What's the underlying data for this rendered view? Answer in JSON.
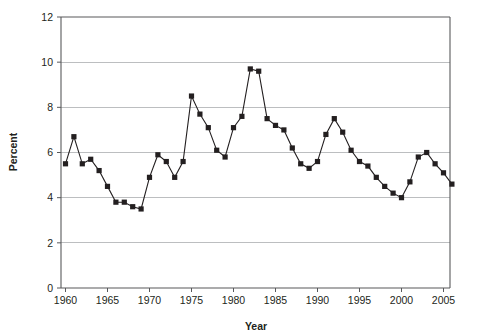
{
  "chart_data": {
    "type": "line",
    "title": "",
    "subtitle": "",
    "xlabel": "Year",
    "ylabel": "Percent",
    "xlim": [
      1959.2,
      1966.0
    ],
    "ylim": [
      0,
      12
    ],
    "xtick_labels": [
      "1960",
      "1965",
      "1970",
      "1975",
      "1980",
      "1985",
      "1990",
      "1995",
      "2000",
      "2005"
    ],
    "xticks": [
      1960,
      1965,
      1970,
      1975,
      1980,
      1985,
      1990,
      1995,
      2000,
      2005
    ],
    "ytick_labels": [
      "0",
      "2",
      "4",
      "6",
      "8",
      "10",
      "12"
    ],
    "yticks": [
      0,
      2,
      4,
      6,
      8,
      10,
      12
    ],
    "grid": "horizontal",
    "legend": "none",
    "marker": "square",
    "x": [
      1960,
      1961,
      1962,
      1963,
      1964,
      1965,
      1966,
      1967,
      1968,
      1969,
      1970,
      1971,
      1972,
      1973,
      1974,
      1975,
      1976,
      1977,
      1978,
      1979,
      1980,
      1981,
      1982,
      1983,
      1984,
      1985,
      1986,
      1987,
      1988,
      1989,
      1990,
      1991,
      1992,
      1993,
      1994,
      1995,
      1996,
      1997,
      1998,
      1999,
      2000,
      2001,
      2002,
      2003,
      2004,
      2005,
      2006
    ],
    "series": [
      {
        "name": "Percent",
        "values": [
          5.5,
          6.7,
          5.5,
          5.7,
          5.2,
          4.5,
          3.8,
          3.8,
          3.6,
          3.5,
          4.9,
          5.9,
          5.6,
          4.9,
          5.6,
          8.5,
          7.7,
          7.1,
          6.1,
          5.8,
          7.1,
          7.6,
          9.7,
          9.6,
          7.5,
          7.2,
          7.0,
          6.2,
          5.5,
          5.3,
          5.6,
          6.8,
          7.5,
          6.9,
          6.1,
          5.6,
          5.4,
          4.9,
          4.5,
          4.2,
          4.0,
          4.7,
          5.8,
          6.0,
          5.5,
          5.1,
          4.6
        ]
      }
    ]
  }
}
